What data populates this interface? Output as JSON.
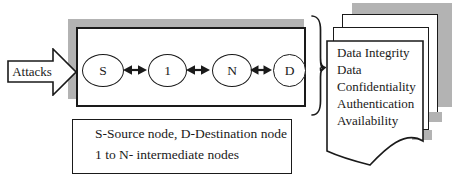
{
  "figure": {
    "attack_arrow": {
      "label": "Attacks"
    },
    "network": {
      "nodes": [
        "S",
        "1",
        "N",
        "D"
      ]
    },
    "security_properties": {
      "lines": [
        "Data Integrity",
        "Data",
        "Confidentiality",
        "Authentication",
        "Availability"
      ]
    },
    "legend": {
      "line1": "S-Source node, D-Destination node",
      "line2": "1 to N- intermediate nodes"
    },
    "colors": {
      "shadow_gray": "#b3b3b3",
      "line_black": "#1a1a1a",
      "page_white": "#ffffff"
    }
  }
}
